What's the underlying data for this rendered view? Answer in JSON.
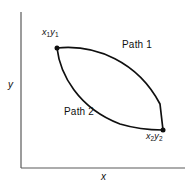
{
  "figure": {
    "background_color": "#ffffff",
    "ink_color": "#0f0f0f",
    "axes": {
      "x_label": "x",
      "y_label": "y",
      "origin": [
        21,
        168
      ],
      "x_axis_end": [
        185,
        168
      ],
      "y_axis_top": [
        21,
        12
      ]
    },
    "points": [
      {
        "id": "start",
        "label_base": "x",
        "label_sub1": "1",
        "label_base2": "y",
        "label_sub2": "1",
        "label_text": "x1y1",
        "coords": [
          57,
          48
        ]
      },
      {
        "id": "end",
        "label_base": "x",
        "label_sub1": "2",
        "label_base2": "y",
        "label_sub2": "2",
        "label_text": "x2y2",
        "coords": [
          163,
          130
        ]
      }
    ],
    "curves": [
      {
        "id": "path1",
        "label": "Path 1",
        "description": "upper-right arc bulging toward upper right",
        "stroke_width": 1.6
      },
      {
        "id": "path2",
        "label": "Path 2",
        "description": "lower-left arc bulging toward lower left",
        "stroke_width": 1.6
      }
    ]
  }
}
